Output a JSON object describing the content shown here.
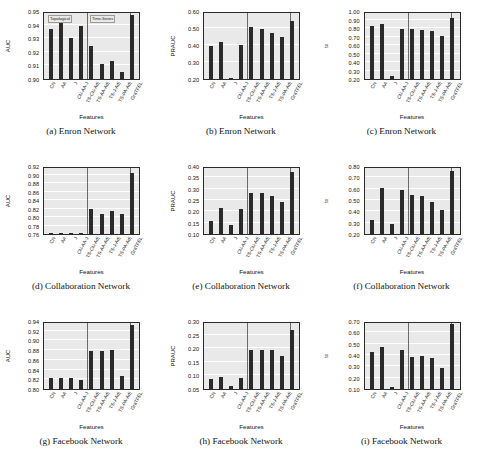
{
  "figure": {
    "features": [
      "CN",
      "AA",
      "J",
      "CN-AA-J",
      "TS-CN-Adj",
      "TS-AA-Adj",
      "TS-J-Adj",
      "TS-PA-Adj",
      "GraTFEL"
    ],
    "xlabel": "Features",
    "region_labels": [
      "Topological",
      "Time-Series"
    ],
    "colors": {
      "bar": "#2a2a2a",
      "plot_bg": "#e9e9e9",
      "grid": "#ffffff",
      "axis": "#2b2b2b"
    }
  },
  "chart_data": [
    {
      "id": "a",
      "type": "bar",
      "title": "(a) Enron Network",
      "xlabel": "Features",
      "ylabel": "AUC",
      "ylabel_sub": "",
      "categories": [
        "CN",
        "AA",
        "J",
        "CN-AA-J",
        "TS-CN-Adj",
        "TS-AA-Adj",
        "TS-J-Adj",
        "TS-PA-Adj",
        "GraTFEL"
      ],
      "values": [
        0.937,
        0.941,
        0.93,
        0.939,
        0.924,
        0.911,
        0.913,
        0.905,
        0.947
      ],
      "ylim": [
        0.9,
        0.95
      ],
      "yticks": [
        0.9,
        0.91,
        0.92,
        0.93,
        0.94,
        0.95
      ],
      "ytick_labels": [
        "0.90",
        "0.91",
        "0.92",
        "0.93",
        "0.94",
        "0.95"
      ],
      "region_labels": [
        "Topological",
        "Time-Series"
      ],
      "grid": true,
      "legend": "none"
    },
    {
      "id": "b",
      "type": "bar",
      "title": "(b) Enron Network",
      "xlabel": "Features",
      "ylabel": "PRAUC",
      "ylabel_sub": "",
      "categories": [
        "CN",
        "AA",
        "J",
        "CN-AA-J",
        "TS-CN-Adj",
        "TS-AA-Adj",
        "TS-J-Adj",
        "TS-PA-Adj",
        "GraTFEL"
      ],
      "values": [
        0.395,
        0.415,
        0.201,
        0.402,
        0.505,
        0.493,
        0.468,
        0.445,
        0.543
      ],
      "ylim": [
        0.2,
        0.6
      ],
      "yticks": [
        0.2,
        0.3,
        0.4,
        0.5,
        0.6
      ],
      "ytick_labels": [
        "0.20",
        "0.30",
        "0.40",
        "0.50",
        "0.60"
      ],
      "region_labels": [],
      "grid": true,
      "legend": "none"
    },
    {
      "id": "c",
      "type": "bar",
      "title": "(c) Enron Network",
      "xlabel": "Features",
      "ylabel": "NDCG",
      "ylabel_sub": "50",
      "categories": [
        "CN",
        "AA",
        "J",
        "CN-AA-J",
        "TS-CN-Adj",
        "TS-AA-Adj",
        "TS-J-Adj",
        "TS-PA-Adj",
        "GraTFEL"
      ],
      "values": [
        0.825,
        0.845,
        0.232,
        0.785,
        0.783,
        0.773,
        0.77,
        0.71,
        0.912
      ],
      "ylim": [
        0.2,
        1.0
      ],
      "yticks": [
        0.2,
        0.3,
        0.4,
        0.5,
        0.6,
        0.7,
        0.8,
        0.9,
        1.0
      ],
      "ytick_labels": [
        "0.20",
        "0.30",
        "0.40",
        "0.50",
        "0.60",
        "0.70",
        "0.80",
        "0.90",
        "1.00"
      ],
      "region_labels": [],
      "grid": true,
      "legend": "none"
    },
    {
      "id": "d",
      "type": "bar",
      "title": "(d) Collaboration Network",
      "xlabel": "Features",
      "ylabel": "AUC",
      "ylabel_sub": "",
      "categories": [
        "CN",
        "AA",
        "J",
        "CN-AA-J",
        "TS-CN-Adj",
        "TS-AA-Adj",
        "TS-J-Adj",
        "TS-PA-Adj",
        "GraTFEL"
      ],
      "values": [
        0.7615,
        0.7615,
        0.7612,
        0.7612,
        0.82,
        0.808,
        0.813,
        0.806,
        0.903
      ],
      "ylim": [
        0.76,
        0.92
      ],
      "yticks": [
        0.76,
        0.78,
        0.8,
        0.82,
        0.84,
        0.86,
        0.88,
        0.9,
        0.92
      ],
      "ytick_labels": [
        "0.76",
        "0.78",
        "0.80",
        "0.82",
        "0.84",
        "0.86",
        "0.88",
        "0.90",
        "0.92"
      ],
      "region_labels": [],
      "grid": true,
      "legend": "none"
    },
    {
      "id": "e",
      "type": "bar",
      "title": "(e) Collaboration Network",
      "xlabel": "Features",
      "ylabel": "PRAUC",
      "ylabel_sub": "",
      "categories": [
        "CN",
        "AA",
        "J",
        "CN-AA-J",
        "TS-CN-Adj",
        "TS-AA-Adj",
        "TS-J-Adj",
        "TS-PA-Adj",
        "GraTFEL"
      ],
      "values": [
        0.157,
        0.215,
        0.141,
        0.21,
        0.279,
        0.281,
        0.267,
        0.241,
        0.372
      ],
      "ylim": [
        0.1,
        0.4
      ],
      "yticks": [
        0.1,
        0.15,
        0.2,
        0.25,
        0.3,
        0.35,
        0.4
      ],
      "ytick_labels": [
        "0.10",
        "0.15",
        "0.20",
        "0.25",
        "0.30",
        "0.35",
        "0.40"
      ],
      "region_labels": [],
      "grid": true,
      "legend": "none"
    },
    {
      "id": "f",
      "type": "bar",
      "title": "(f) Collaboration Network",
      "xlabel": "Features",
      "ylabel": "NDCG",
      "ylabel_sub": "50",
      "categories": [
        "CN",
        "AA",
        "J",
        "CN-AA-J",
        "TS-CN-Adj",
        "TS-AA-Adj",
        "TS-J-Adj",
        "TS-PA-Adj",
        "GraTFEL"
      ],
      "values": [
        0.325,
        0.605,
        0.29,
        0.587,
        0.545,
        0.538,
        0.48,
        0.41,
        0.757
      ],
      "ylim": [
        0.2,
        0.8
      ],
      "yticks": [
        0.2,
        0.3,
        0.4,
        0.5,
        0.6,
        0.7,
        0.8
      ],
      "ytick_labels": [
        "0.20",
        "0.30",
        "0.40",
        "0.50",
        "0.60",
        "0.70",
        "0.80"
      ],
      "region_labels": [],
      "grid": true,
      "legend": "none"
    },
    {
      "id": "g",
      "type": "bar",
      "title": "(g) Facebook Network",
      "xlabel": "Features",
      "ylabel": "AUC",
      "ylabel_sub": "",
      "categories": [
        "CN",
        "AA",
        "J",
        "CN-AA-J",
        "TS-CN-Adj",
        "TS-AA-Adj",
        "TS-J-Adj",
        "TS-PA-Adj",
        "GraTFEL"
      ],
      "values": [
        0.822,
        0.823,
        0.822,
        0.818,
        0.879,
        0.879,
        0.881,
        0.827,
        0.931
      ],
      "ylim": [
        0.8,
        0.94
      ],
      "yticks": [
        0.8,
        0.82,
        0.84,
        0.86,
        0.88,
        0.9,
        0.92,
        0.94
      ],
      "ytick_labels": [
        "0.80",
        "0.82",
        "0.84",
        "0.86",
        "0.88",
        "0.90",
        "0.92",
        "0.94"
      ],
      "region_labels": [],
      "grid": true,
      "legend": "none"
    },
    {
      "id": "h",
      "type": "bar",
      "title": "(h) Facebook Network",
      "xlabel": "Features",
      "ylabel": "PRAUC",
      "ylabel_sub": "",
      "categories": [
        "CN",
        "AA",
        "J",
        "CN-AA-J",
        "TS-CN-Adj",
        "TS-AA-Adj",
        "TS-J-Adj",
        "TS-PA-Adj",
        "GraTFEL"
      ],
      "values": [
        0.086,
        0.094,
        0.062,
        0.09,
        0.192,
        0.193,
        0.193,
        0.17,
        0.266
      ],
      "ylim": [
        0.05,
        0.3
      ],
      "yticks": [
        0.05,
        0.1,
        0.15,
        0.2,
        0.25,
        0.3
      ],
      "ytick_labels": [
        "0.05",
        "0.10",
        "0.15",
        "0.20",
        "0.25",
        "0.30"
      ],
      "region_labels": [],
      "grid": true,
      "legend": "none"
    },
    {
      "id": "i",
      "type": "bar",
      "title": "(i) Facebook Network",
      "xlabel": "Features",
      "ylabel": "NDCG",
      "ylabel_sub": "50",
      "categories": [
        "CN",
        "AA",
        "J",
        "CN-AA-J",
        "TS-CN-Adj",
        "TS-AA-Adj",
        "TS-J-Adj",
        "TS-PA-Adj",
        "GraTFEL"
      ],
      "values": [
        0.425,
        0.468,
        0.115,
        0.44,
        0.385,
        0.39,
        0.378,
        0.285,
        0.678
      ],
      "ylim": [
        0.1,
        0.7
      ],
      "yticks": [
        0.1,
        0.2,
        0.3,
        0.4,
        0.5,
        0.6,
        0.7
      ],
      "ytick_labels": [
        "0.10",
        "0.20",
        "0.30",
        "0.40",
        "0.50",
        "0.60",
        "0.70"
      ],
      "region_labels": [],
      "grid": true,
      "legend": "none"
    }
  ]
}
